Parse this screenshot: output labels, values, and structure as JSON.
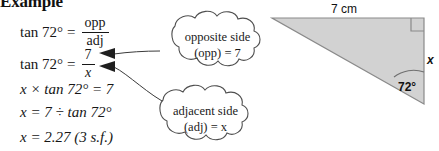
{
  "heading": {
    "text": "Example"
  },
  "solution": {
    "lines": [
      {
        "id": "line-1",
        "type": "fraction-equation",
        "lhs": "tan 72°",
        "relation": "=",
        "numerator": "opp",
        "denominator": "adj"
      },
      {
        "id": "line-2",
        "type": "fraction-equation",
        "lhs": "tan 72°",
        "relation": "=",
        "numerator": "7",
        "denominator": "x"
      },
      {
        "id": "line-3",
        "type": "plain-equation",
        "text": "x × tan 72° = 7"
      },
      {
        "id": "line-4",
        "type": "plain-equation",
        "text": "x = 7 ÷ tan 72°"
      },
      {
        "id": "line-5",
        "type": "plain-equation",
        "text": "x = 2.27 (3 s.f.)"
      }
    ]
  },
  "callouts": [
    {
      "id": "callout-opposite",
      "line_1": "opposite side",
      "line_2": "(opp) = 7",
      "points_to": "numerator-7"
    },
    {
      "id": "callout-adjacent",
      "line_1": "adjacent side",
      "line_2": "(adj) = x",
      "points_to": "denominator-x"
    }
  ],
  "diagram": {
    "top_side_label": "7 cm",
    "right_side_label": "x",
    "angle_label": "72°",
    "right_angle_marker": "right-angle-square",
    "fill_color": "#d2d2d2",
    "stroke_color": "#7a7a7a"
  },
  "colors": {
    "background": "#ffffff",
    "text": "#161616",
    "callout_outline": "#555555",
    "arrow": "#2a2a2a"
  }
}
